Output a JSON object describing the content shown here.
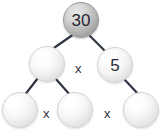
{
  "diagram": {
    "type": "factor-tree",
    "background_color": "#ffffff",
    "line_color": "#2f3545",
    "nodes": [
      {
        "id": "root",
        "label": "30",
        "filled": true,
        "x": 63,
        "y": 2,
        "size": 36
      },
      {
        "id": "mid-left",
        "label": "",
        "filled": false,
        "x": 29,
        "y": 46,
        "size": 36
      },
      {
        "id": "mid-right",
        "label": "5",
        "filled": false,
        "x": 97,
        "y": 47,
        "size": 36
      },
      {
        "id": "leaf-left",
        "label": "",
        "filled": false,
        "x": 2,
        "y": 92,
        "size": 36
      },
      {
        "id": "leaf-middle",
        "label": "",
        "filled": false,
        "x": 57,
        "y": 92,
        "size": 36
      },
      {
        "id": "leaf-right",
        "label": "",
        "filled": false,
        "x": 123,
        "y": 92,
        "size": 36
      }
    ],
    "operators": [
      {
        "id": "op-mid",
        "label": "x",
        "x": 75,
        "y": 62
      },
      {
        "id": "op-leaf-left",
        "label": "x",
        "x": 43,
        "y": 107
      },
      {
        "id": "op-leaf-right",
        "label": "x",
        "x": 104,
        "y": 107
      }
    ],
    "edges": [
      {
        "id": "edge-root-midleft",
        "from": "root",
        "to": "mid-left",
        "x1": 74,
        "y1": 34,
        "x2": 51,
        "y2": 50
      },
      {
        "id": "edge-root-midright",
        "from": "root",
        "to": "mid-right",
        "x1": 88,
        "y1": 34,
        "x2": 106,
        "y2": 52
      },
      {
        "id": "edge-midleft-leafleft",
        "from": "mid-left",
        "to": "leaf-left",
        "x1": 38,
        "y1": 78,
        "x2": 24,
        "y2": 96
      },
      {
        "id": "edge-midleft-leafmid",
        "from": "mid-left",
        "to": "leaf-middle",
        "x1": 55,
        "y1": 78,
        "x2": 71,
        "y2": 96
      },
      {
        "id": "edge-midright-leafright",
        "from": "mid-right",
        "to": "leaf-right",
        "x1": 124,
        "y1": 79,
        "x2": 140,
        "y2": 96
      }
    ]
  }
}
